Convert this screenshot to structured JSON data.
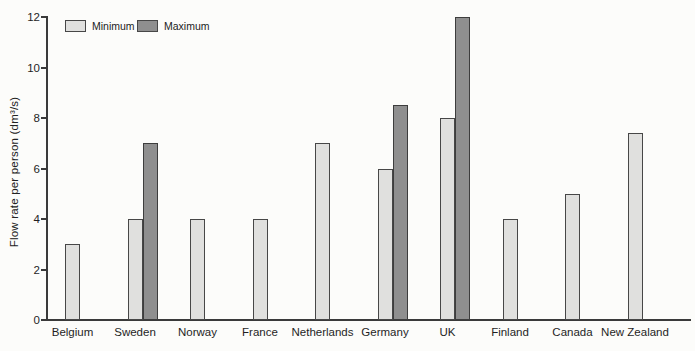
{
  "figure": {
    "kind": "scanned-book-bar-chart"
  },
  "colors": {
    "background": "#fcfcfa",
    "minimum_fill": "#e0e0de",
    "maximum_fill": "#8f8f8f",
    "bar_border": "#474747",
    "axis": "#3a3a3a",
    "text": "#1f1f1f"
  },
  "legend": {
    "items": [
      {
        "label": "Minimum",
        "color_key": "minimum_fill"
      },
      {
        "label": "Maximum",
        "color_key": "maximum_fill"
      }
    ],
    "position": "top-left"
  },
  "chart_data": {
    "type": "bar",
    "title": "",
    "xlabel": "",
    "ylabel": "Flow rate per person (dm³/s)",
    "categories": [
      "Belgium",
      "Sweden",
      "Norway",
      "France",
      "Netherlands",
      "Germany",
      "UK",
      "Finland",
      "Canada",
      "New Zealand"
    ],
    "series": [
      {
        "name": "Minimum",
        "values": [
          3,
          4,
          4,
          4,
          7,
          6,
          8,
          4,
          5,
          7.4
        ]
      },
      {
        "name": "Maximum",
        "values": [
          null,
          7,
          null,
          null,
          null,
          8.5,
          12,
          null,
          null,
          null
        ]
      }
    ],
    "ylim": [
      0,
      12
    ],
    "yticks": [
      0,
      2,
      4,
      6,
      8,
      10,
      12
    ],
    "grid": false,
    "legend_position": "top-left"
  }
}
